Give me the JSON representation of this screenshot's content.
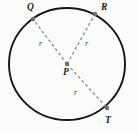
{
  "figure": {
    "kind": "geometry-diagram",
    "background_color": "#fbfbfa",
    "circle": {
      "name": "circle-outline",
      "stroke_color": "#161616",
      "center": {
        "x": 67,
        "y": 64
      },
      "radius_x": 58,
      "radius_y": 56
    },
    "radii_style": {
      "stroke_color": "#9a9a9a",
      "dash": "3 2.5"
    },
    "points": [
      {
        "id": "Q",
        "label": "Q",
        "x": 33,
        "y": 19,
        "label_x": 27,
        "label_y": 3
      },
      {
        "id": "R",
        "label": "R",
        "x": 95,
        "y": 14,
        "label_x": 101,
        "label_y": 3
      },
      {
        "id": "P",
        "label": "P",
        "x": 67,
        "y": 64,
        "label_x": 63,
        "label_y": 68
      },
      {
        "id": "T",
        "label": "T",
        "x": 107,
        "y": 108,
        "label_x": 105,
        "label_y": 116
      }
    ],
    "segments": [
      {
        "id": "PQ",
        "from": "P",
        "to": "Q",
        "label": "r",
        "label_x": 39,
        "label_y": 40
      },
      {
        "id": "PR",
        "from": "P",
        "to": "R",
        "label": "r",
        "label_x": 85,
        "label_y": 40
      },
      {
        "id": "PT",
        "from": "P",
        "to": "T",
        "label": "r",
        "label_x": 74,
        "label_y": 89
      }
    ]
  }
}
